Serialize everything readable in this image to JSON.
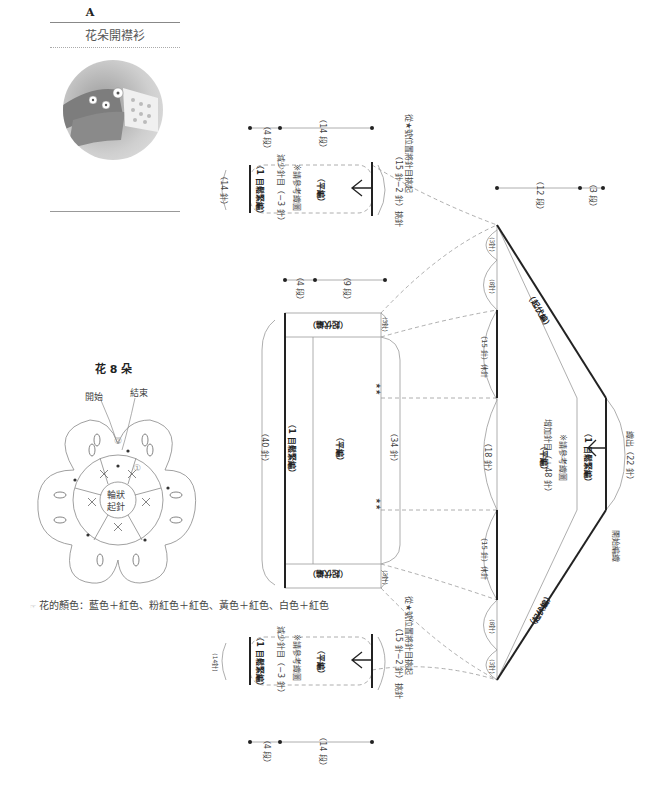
{
  "header": {
    "letter": "A",
    "title": "花朵開襟衫"
  },
  "photo": {
    "alt": "cardigan-photo"
  },
  "flower": {
    "title": "花 8 朵",
    "start_label": "開始",
    "end_label": "結束",
    "center_label_1": "輪狀",
    "center_label_2": "起針",
    "round_1": "①",
    "round_2": "②"
  },
  "legend": {
    "icon": "note-icon",
    "text": "花的顏色：藍色＋紅色、粉紅色＋紅色、黃色＋紅色、白色＋紅色"
  },
  "sleeve_top": {
    "rows_a": "（4 段）",
    "rows_b": "（14 段）",
    "width": "（14 針）",
    "band": "（1 目鬆緊編）",
    "dec": "減少針目（−3 針）",
    "dec_note": "※請參考織圖",
    "body": "（平編）",
    "pickup": "（15 針−2 針）挑針",
    "pickup_note": "從★號位置將針目挑起"
  },
  "back": {
    "rows_a": "（4 段）",
    "rows_b": "（9 段）",
    "width": "（40 針）",
    "band": "（1 目鬆緊編）",
    "body": "（平編）",
    "inner_width": "（34 針）",
    "edge_top": "（起伏編）",
    "edge_bottom": "（起伏編）",
    "small_top": "(3針)",
    "small_bottom": "(3針)",
    "stars": "★★"
  },
  "yoke": {
    "rows_a": "（12 段）",
    "rows_b": "（3 段）",
    "s1": "(3針)",
    "s2": "(8針)",
    "s3": "（15 針）休針",
    "s4": "（18 針）",
    "s5": "（15 針）休針",
    "s6": "(8針)",
    "s7": "(3針)",
    "body": "（平編）",
    "inc": "增加針目（＋48 針）",
    "inc_note": "※請參考織圖",
    "band": "（1 目鬆緊編）",
    "edge_top": "（起伏編）",
    "edge_bottom": "（起伏編）",
    "cast": "織出（22 針）",
    "start": "開始編織"
  },
  "sleeve_bottom": {
    "rows_a": "（4 段）",
    "rows_b": "（14 段）",
    "width": "(14針)",
    "band": "（1 目鬆緊編）",
    "dec": "減少針目（−3 針）",
    "dec_note": "※請參考織圖",
    "body": "（平編）",
    "pickup": "（15 針−2 針）挑針",
    "pickup_note": "從★號位置將針目挑起"
  }
}
